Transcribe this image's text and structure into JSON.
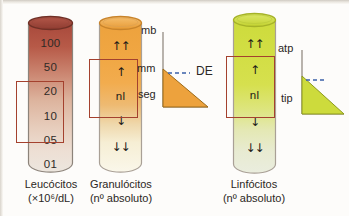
{
  "figure": {
    "background": "#fdfcfa"
  },
  "colors": {
    "leukocyte_top": "#a8493c",
    "leukocyte_bottom": "#ece5dd",
    "granulocyte_top": "#eda23d",
    "granulocyte_bottom": "#f7f4e6",
    "lymphocyte_top": "#cddb3c",
    "lymphocyte_bottom": "#eceee0",
    "redbox_border": "#a4412e",
    "outline": "#8c837a",
    "text": "#2b2724",
    "dashed_line": "#3a5fa8"
  },
  "columns": [
    {
      "id": "leukocytes",
      "caption_line1": "Leucócitos",
      "caption_line2": "(×10⁶/dL)",
      "scale_type": "numeric",
      "ticks": [
        "100",
        "50",
        "20",
        "10",
        "05",
        "01"
      ],
      "normal_range_highlight": [
        "20",
        "10",
        "05"
      ],
      "units": "×10⁶/dL"
    },
    {
      "id": "granulocytes",
      "caption_line1": "Granulócitos",
      "caption_line2": "(nº absoluto)",
      "scale_type": "arrows",
      "ticks": [
        "↑↑",
        "↑",
        "nl",
        "↓",
        "↓↓"
      ],
      "normal_range_highlight": [
        "↑",
        "nl",
        "↓"
      ],
      "units": "nº absoluto"
    },
    {
      "id": "lymphocytes",
      "caption_line1": "Linfócitos",
      "caption_line2": "(nº absoluto)",
      "scale_type": "arrows",
      "ticks": [
        "↑↑",
        "↑",
        "nl",
        "↓",
        "↓↓"
      ],
      "normal_range_highlight": [
        "↑",
        "nl",
        "↓"
      ],
      "units": "nº absoluto"
    }
  ],
  "triangles": [
    {
      "id": "granulocyte-maturation",
      "axis_labels": [
        "mb",
        "mm",
        "seg"
      ],
      "annotation": "DE",
      "fill": "#eda23d"
    },
    {
      "id": "lymphocyte-maturation",
      "axis_labels": [
        "atp",
        "tip"
      ],
      "annotation": "",
      "fill": "#cddb3c"
    }
  ]
}
